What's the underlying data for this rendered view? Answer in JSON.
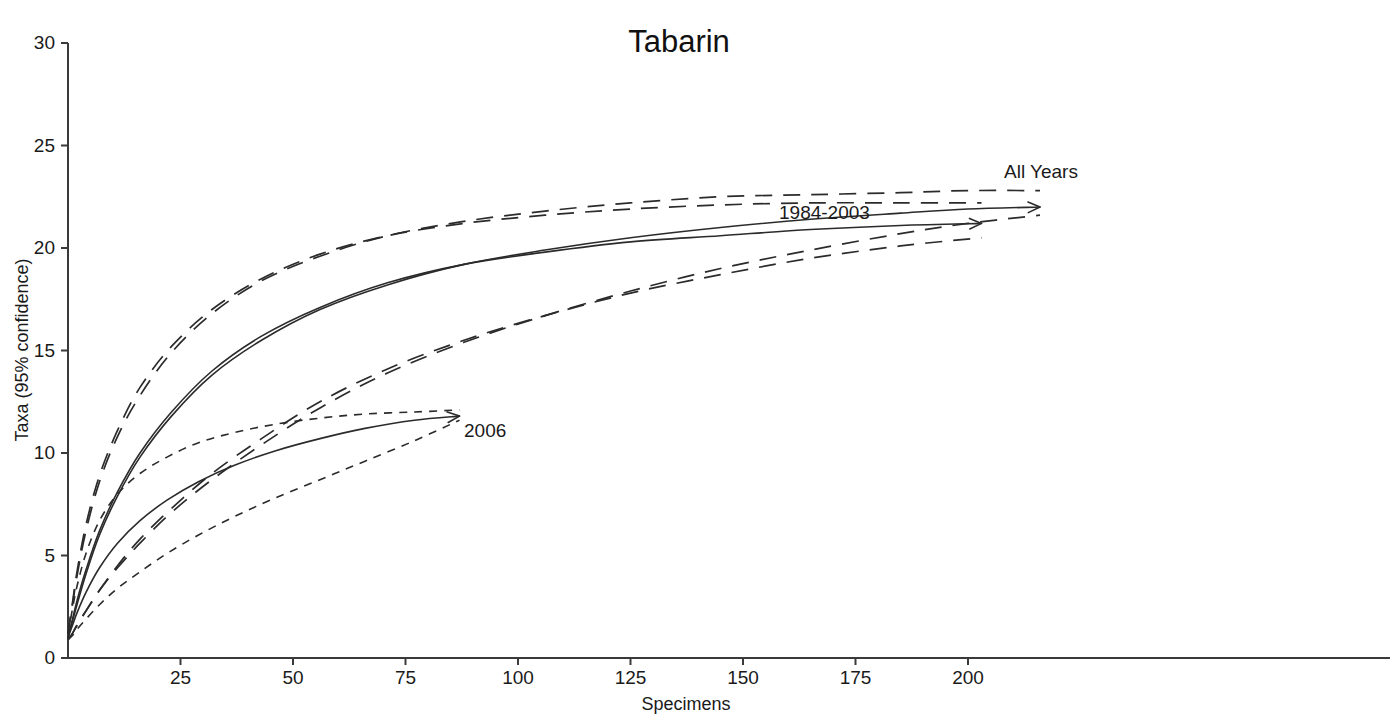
{
  "chart_data": {
    "type": "line",
    "title": "Tabarin",
    "xlabel": "Specimens",
    "ylabel": "Taxa (95% confidence)",
    "xlim": [
      0,
      217
    ],
    "ylim": [
      0,
      30
    ],
    "xticks": [
      0,
      25,
      50,
      75,
      100,
      125,
      150,
      175,
      200
    ],
    "xtick_labels": [
      "0",
      "25",
      "50",
      "75",
      "100",
      "125",
      "150",
      "175",
      "200"
    ],
    "yticks": [
      0,
      5,
      10,
      15,
      20,
      25,
      30
    ],
    "ytick_labels": [
      "0",
      "5",
      "10",
      "15",
      "20",
      "25",
      "30"
    ],
    "grid": false,
    "legend": "inline-annotations",
    "annotations": [
      {
        "text": "All Years",
        "x": 208,
        "y": 23.4
      },
      {
        "text": "1984-2003",
        "x": 158,
        "y": 21.4
      },
      {
        "text": "2006",
        "x": 88,
        "y": 10.8
      }
    ],
    "series": [
      {
        "name": "All Years",
        "style": "solid",
        "role": "mean",
        "end_arrow": true,
        "x": [
          0,
          1,
          2,
          4,
          7,
          11,
          16,
          23,
          32,
          43,
          56,
          71,
          88,
          106,
          125,
          145,
          165,
          185,
          200,
          216
        ],
        "y": [
          1.0,
          1.8,
          2.6,
          4.1,
          6.0,
          7.9,
          9.8,
          11.8,
          13.8,
          15.5,
          17.0,
          18.2,
          19.2,
          19.9,
          20.5,
          21.0,
          21.4,
          21.7,
          21.9,
          22.0
        ]
      },
      {
        "name": "All Years upper 95%",
        "style": "long-dash",
        "role": "upper",
        "end_arrow": false,
        "x": [
          0,
          1,
          2,
          4,
          7,
          11,
          16,
          23,
          32,
          43,
          56,
          71,
          88,
          106,
          125,
          145,
          165,
          185,
          200,
          216
        ],
        "y": [
          1.2,
          2.6,
          4.0,
          6.2,
          8.6,
          10.8,
          12.8,
          14.9,
          16.8,
          18.4,
          19.6,
          20.6,
          21.3,
          21.8,
          22.2,
          22.5,
          22.6,
          22.7,
          22.8,
          22.8
        ]
      },
      {
        "name": "All Years lower 95%",
        "style": "long-dash",
        "role": "lower",
        "end_arrow": false,
        "x": [
          0,
          1,
          2,
          4,
          7,
          11,
          16,
          23,
          32,
          43,
          56,
          71,
          88,
          106,
          125,
          145,
          165,
          185,
          200,
          216
        ],
        "y": [
          0.9,
          1.2,
          1.6,
          2.3,
          3.3,
          4.4,
          5.6,
          7.1,
          8.7,
          10.4,
          12.2,
          13.9,
          15.4,
          16.7,
          17.9,
          19.0,
          19.9,
          20.7,
          21.2,
          21.6
        ]
      },
      {
        "name": "1984-2003",
        "style": "solid",
        "role": "mean",
        "end_arrow": true,
        "x": [
          0,
          1,
          2,
          4,
          7,
          11,
          16,
          23,
          32,
          43,
          56,
          71,
          88,
          106,
          125,
          145,
          165,
          185,
          203
        ],
        "y": [
          1.0,
          1.9,
          2.8,
          4.3,
          6.2,
          8.1,
          10.0,
          12.0,
          14.0,
          15.7,
          17.1,
          18.3,
          19.2,
          19.8,
          20.3,
          20.6,
          20.9,
          21.1,
          21.2
        ]
      },
      {
        "name": "1984-2003 upper 95%",
        "style": "long-dash",
        "role": "upper",
        "end_arrow": false,
        "x": [
          0,
          1,
          2,
          4,
          7,
          11,
          16,
          23,
          32,
          43,
          56,
          71,
          88,
          106,
          125,
          145,
          165,
          185,
          203
        ],
        "y": [
          1.2,
          2.7,
          4.2,
          6.5,
          8.9,
          11.1,
          13.2,
          15.2,
          17.0,
          18.5,
          19.7,
          20.6,
          21.2,
          21.6,
          21.9,
          22.1,
          22.2,
          22.2,
          22.2
        ]
      },
      {
        "name": "1984-2003 lower 95%",
        "style": "long-dash",
        "role": "lower",
        "end_arrow": false,
        "x": [
          0,
          1,
          2,
          4,
          7,
          11,
          16,
          23,
          32,
          43,
          56,
          71,
          88,
          106,
          125,
          145,
          165,
          185,
          203
        ],
        "y": [
          0.9,
          1.2,
          1.6,
          2.3,
          3.3,
          4.5,
          5.8,
          7.3,
          9.0,
          10.7,
          12.5,
          14.1,
          15.5,
          16.7,
          17.8,
          18.7,
          19.5,
          20.1,
          20.5
        ]
      },
      {
        "name": "2006",
        "style": "solid",
        "role": "mean",
        "end_arrow": true,
        "x": [
          0,
          1,
          2,
          4,
          7,
          11,
          16,
          22,
          29,
          37,
          46,
          56,
          66,
          77,
          87
        ],
        "y": [
          1.0,
          1.6,
          2.2,
          3.2,
          4.4,
          5.6,
          6.7,
          7.7,
          8.6,
          9.4,
          10.1,
          10.7,
          11.2,
          11.6,
          11.8
        ]
      },
      {
        "name": "2006 upper 95%",
        "style": "short-dash",
        "role": "upper",
        "end_arrow": false,
        "x": [
          0,
          1,
          2,
          4,
          7,
          11,
          16,
          22,
          29,
          37,
          46,
          56,
          66,
          77,
          87
        ],
        "y": [
          1.2,
          2.4,
          3.5,
          5.1,
          6.7,
          8.0,
          9.0,
          9.8,
          10.5,
          11.0,
          11.4,
          11.7,
          11.9,
          12.0,
          12.1
        ]
      },
      {
        "name": "2006 lower 95%",
        "style": "short-dash",
        "role": "lower",
        "end_arrow": false,
        "x": [
          0,
          1,
          2,
          4,
          7,
          11,
          16,
          22,
          29,
          37,
          46,
          56,
          66,
          77,
          87
        ],
        "y": [
          0.9,
          1.1,
          1.4,
          1.9,
          2.6,
          3.4,
          4.2,
          5.1,
          6.0,
          6.9,
          7.8,
          8.7,
          9.6,
          10.6,
          11.6
        ]
      }
    ]
  },
  "title": "Tabarin",
  "axes": {
    "x_title": "Specimens",
    "y_title": "Taxa (95% confidence)"
  },
  "labels": {
    "all_years": "All Years",
    "period_1984_2003": "1984-2003",
    "year_2006": "2006"
  },
  "colors": {
    "axis": "#3a3a3a",
    "curve": "#2b2b2b",
    "text": "#1a1a1a",
    "background": "#ffffff"
  }
}
